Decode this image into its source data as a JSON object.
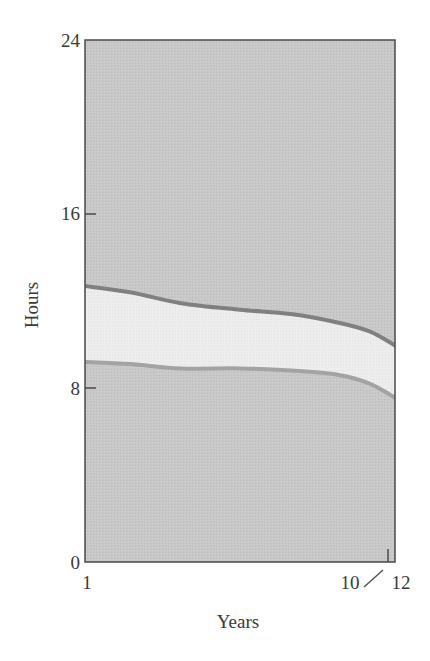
{
  "chart_data": {
    "type": "area",
    "title": "",
    "xlabel": "Years",
    "ylabel": "Hours",
    "xlim": [
      1,
      12
    ],
    "ylim": [
      0,
      24
    ],
    "grid": false,
    "legend": null,
    "x_ticks": [
      {
        "value": 1,
        "label": "1"
      },
      {
        "value": 12,
        "label": "12"
      }
    ],
    "x_axis_break": {
      "label_before": "10",
      "label_after": "12",
      "symbol": "/"
    },
    "y_ticks": [
      {
        "value": 0,
        "label": "0"
      },
      {
        "value": 8,
        "label": "8"
      },
      {
        "value": 16,
        "label": "16"
      },
      {
        "value": 24,
        "label": "24"
      }
    ],
    "x": [
      1,
      2.6,
      4.4,
      6.5,
      8.3,
      10.0,
      11.1,
      12
    ],
    "series": [
      {
        "name": "upper-boundary",
        "values": [
          12.7,
          12.4,
          11.9,
          11.6,
          11.4,
          11.0,
          10.6,
          9.9
        ],
        "color": "#808080"
      },
      {
        "name": "lower-boundary",
        "values": [
          9.2,
          9.1,
          8.9,
          8.9,
          8.8,
          8.6,
          8.2,
          7.5
        ],
        "color": "#a3a3a3"
      }
    ],
    "band_fill": "#ececec",
    "background_fill": "#c6c6c6"
  },
  "labels": {
    "y_axis_title": "Hours",
    "x_axis_title": "Years",
    "y_tick_24": "24",
    "y_tick_16": "16",
    "y_tick_8": "8",
    "y_tick_0": "0",
    "x_tick_1": "1",
    "x_tick_10": "10",
    "x_tick_12": "12"
  },
  "colors": {
    "axis": "#4a4a4a",
    "outer_fill": "#c6c6c6",
    "band_fill": "#ececec",
    "upper_line": "#808080",
    "lower_line": "#a3a3a3"
  }
}
